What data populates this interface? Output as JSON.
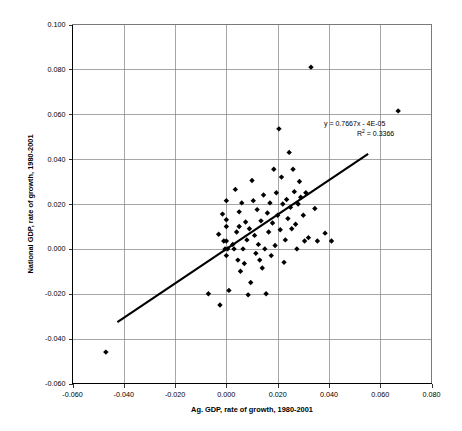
{
  "chart_data": {
    "type": "scatter",
    "title": "",
    "xlabel": "Ag. GDP, rate of growth, 1980-2001",
    "ylabel": "National GDP, rate of growth, 1980-2001",
    "xlim": [
      -0.06,
      0.08
    ],
    "ylim": [
      -0.06,
      0.1
    ],
    "xticks": [
      -0.06,
      -0.04,
      -0.02,
      0.0,
      0.02,
      0.04,
      0.06,
      0.08
    ],
    "yticks": [
      -0.06,
      -0.04,
      -0.02,
      0.0,
      0.02,
      0.04,
      0.06,
      0.08,
      0.1
    ],
    "xtick_labels": [
      "-0.060",
      "-0.040",
      "-0.020",
      "0.000",
      "0.020",
      "0.040",
      "0.060",
      "0.080"
    ],
    "ytick_labels": [
      "-0.060",
      "-0.040",
      "-0.020",
      "0.000",
      "0.020",
      "0.040",
      "0.060",
      "0.080",
      "0.100"
    ],
    "grid": true,
    "grid_axes": "both",
    "legend": "none",
    "marker": "diamond",
    "marker_color": "#000000",
    "annotations": {
      "equation": "y = 0.7667x - 4E-05",
      "r_squared_prefix": "R",
      "r_squared_sup": "2",
      "r_squared_value": " = 0.3366"
    },
    "trendline": {
      "type": "linear",
      "slope": 0.7667,
      "intercept": -4e-05,
      "x_start": -0.0425,
      "x_end": 0.0553
    },
    "points": [
      [
        -0.047,
        -0.046
      ],
      [
        -0.007,
        -0.02
      ],
      [
        -0.003,
        0.0065
      ],
      [
        -0.0025,
        -0.025
      ],
      [
        -0.0015,
        0.0155
      ],
      [
        -0.001,
        0.0035
      ],
      [
        -0.0005,
        0.0
      ],
      [
        0.0,
        0.0215
      ],
      [
        0.0,
        0.013
      ],
      [
        0.0,
        0.01
      ],
      [
        0.0,
        0.0035
      ],
      [
        0.0,
        -0.003
      ],
      [
        0.0005,
        0.0
      ],
      [
        0.001,
        -0.0185
      ],
      [
        0.0025,
        0.002
      ],
      [
        0.003,
        0.0
      ],
      [
        0.0035,
        0.0265
      ],
      [
        0.004,
        0.0075
      ],
      [
        0.0045,
        -0.005
      ],
      [
        0.005,
        0.0165
      ],
      [
        0.005,
        0.01
      ],
      [
        0.0055,
        -0.01
      ],
      [
        0.006,
        0.0205
      ],
      [
        0.0065,
        0.0
      ],
      [
        0.007,
        -0.0065
      ],
      [
        0.0075,
        0.012
      ],
      [
        0.008,
        0.004
      ],
      [
        0.0085,
        -0.0205
      ],
      [
        0.009,
        0.009
      ],
      [
        0.0095,
        -0.015
      ],
      [
        0.01,
        0.0305
      ],
      [
        0.0105,
        0.0215
      ],
      [
        0.011,
        0.006
      ],
      [
        0.0115,
        -0.002
      ],
      [
        0.012,
        0.0175
      ],
      [
        0.0125,
        0.002
      ],
      [
        0.013,
        -0.005
      ],
      [
        0.0135,
        0.0125
      ],
      [
        0.014,
        -0.0085
      ],
      [
        0.0145,
        0.024
      ],
      [
        0.015,
        0.0
      ],
      [
        0.0155,
        -0.02
      ],
      [
        0.016,
        0.016
      ],
      [
        0.0165,
        0.0075
      ],
      [
        0.017,
        0.0205
      ],
      [
        0.0175,
        -0.003
      ],
      [
        0.018,
        0.0115
      ],
      [
        0.0185,
        0.0355
      ],
      [
        0.019,
        0.0015
      ],
      [
        0.0195,
        0.025
      ],
      [
        0.02,
        0.015
      ],
      [
        0.0205,
        0.0535
      ],
      [
        0.021,
        0.0085
      ],
      [
        0.0215,
        0.032
      ],
      [
        0.022,
        0.02
      ],
      [
        0.0225,
        -0.006
      ],
      [
        0.023,
        0.004
      ],
      [
        0.0235,
        0.022
      ],
      [
        0.024,
        0.0135
      ],
      [
        0.0245,
        0.043
      ],
      [
        0.025,
        0.0185
      ],
      [
        0.0255,
        0.009
      ],
      [
        0.026,
        0.0355
      ],
      [
        0.0265,
        0.0255
      ],
      [
        0.027,
        0.011
      ],
      [
        0.0275,
        0.0
      ],
      [
        0.028,
        0.02
      ],
      [
        0.0285,
        0.03
      ],
      [
        0.029,
        0.023
      ],
      [
        0.03,
        0.015
      ],
      [
        0.0305,
        0.0035
      ],
      [
        0.031,
        0.025
      ],
      [
        0.032,
        0.005
      ],
      [
        0.033,
        0.081
      ],
      [
        0.0345,
        0.018
      ],
      [
        0.0355,
        0.0035
      ],
      [
        0.0385,
        0.007
      ],
      [
        0.041,
        0.0035
      ],
      [
        0.067,
        0.0615
      ]
    ]
  }
}
